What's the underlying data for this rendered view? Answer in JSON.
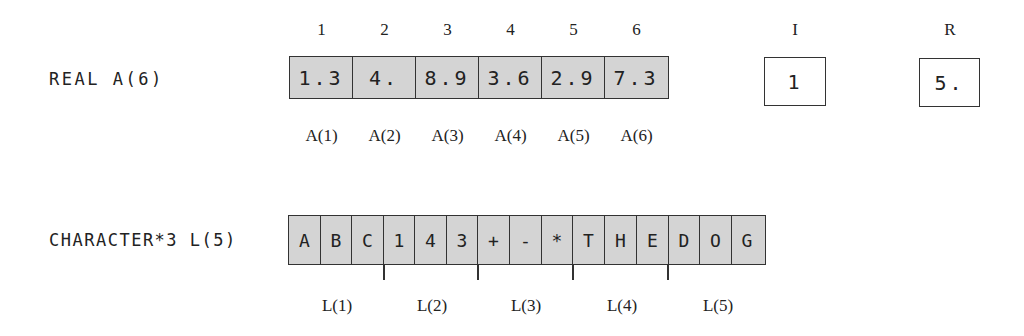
{
  "real_array": {
    "declaration": "REAL A(6)",
    "indices": [
      "1",
      "2",
      "3",
      "4",
      "5",
      "6"
    ],
    "values": [
      "1.3",
      "4.",
      "8.9",
      "3.6",
      "2.9",
      "7.3"
    ],
    "labels": [
      "A(1)",
      "A(2)",
      "A(3)",
      "A(4)",
      "A(5)",
      "A(6)"
    ]
  },
  "scalars": {
    "I": {
      "name": "I",
      "value": "1"
    },
    "R": {
      "name": "R",
      "value": "5."
    }
  },
  "char_array": {
    "declaration": "CHARACTER*3 L(5)",
    "chars": [
      "A",
      "B",
      "C",
      "1",
      "4",
      "3",
      "+",
      "-",
      "*",
      "T",
      "H",
      "E",
      "D",
      "O",
      "G"
    ],
    "labels": [
      "L(1)",
      "L(2)",
      "L(3)",
      "L(4)",
      "L(5)"
    ],
    "element_length": 3
  },
  "colors": {
    "cell_fill": "#d4d4d4",
    "border": "#333333",
    "background": "#ffffff"
  }
}
